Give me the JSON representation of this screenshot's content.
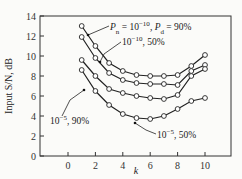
{
  "chart_data": {
    "type": "line",
    "title": "",
    "xlabel": "k",
    "ylabel": "Input S/N, dB",
    "xlim": [
      -1.5,
      11.5
    ],
    "ylim": [
      0,
      14
    ],
    "grid": false,
    "x_ticks": [
      "0",
      "2",
      "4",
      "6",
      "8",
      "10"
    ],
    "y_ticks": [
      "0",
      "2",
      "4",
      "6",
      "8",
      "10",
      "12",
      "14"
    ],
    "x": [
      1,
      2,
      3,
      4,
      5,
      6,
      7,
      8,
      9,
      10
    ],
    "series": [
      {
        "name": "Pn = 10^-10, Pd = 90%",
        "values": [
          13.0,
          11.0,
          9.3,
          8.5,
          8.1,
          8.0,
          8.0,
          8.1,
          9.0,
          10.1
        ]
      },
      {
        "name": "10^-10, 50%",
        "values": [
          11.9,
          9.8,
          8.3,
          7.6,
          7.3,
          7.2,
          7.2,
          7.1,
          8.5,
          9.1
        ]
      },
      {
        "name": "10^-5, 90%",
        "values": [
          9.6,
          8.0,
          6.7,
          6.3,
          6.0,
          5.8,
          5.7,
          6.1,
          8.0,
          8.7
        ]
      },
      {
        "name": "10^-5, 50%",
        "values": [
          8.6,
          6.5,
          5.1,
          4.2,
          3.8,
          3.7,
          4.0,
          4.7,
          5.5,
          5.8
        ]
      }
    ],
    "annotations": [
      {
        "text_parts": [
          "P",
          "n",
          " = 10",
          "−10",
          ", P",
          "d",
          " = 90%"
        ],
        "series": 0
      },
      {
        "text_parts": [
          "10",
          "−10",
          ", 50%"
        ],
        "series": 1
      },
      {
        "text_parts": [
          "10",
          "−5",
          ", 90%"
        ],
        "series": 2
      },
      {
        "text_parts": [
          "10",
          "−5",
          ", 50%"
        ],
        "series": 3
      }
    ]
  }
}
